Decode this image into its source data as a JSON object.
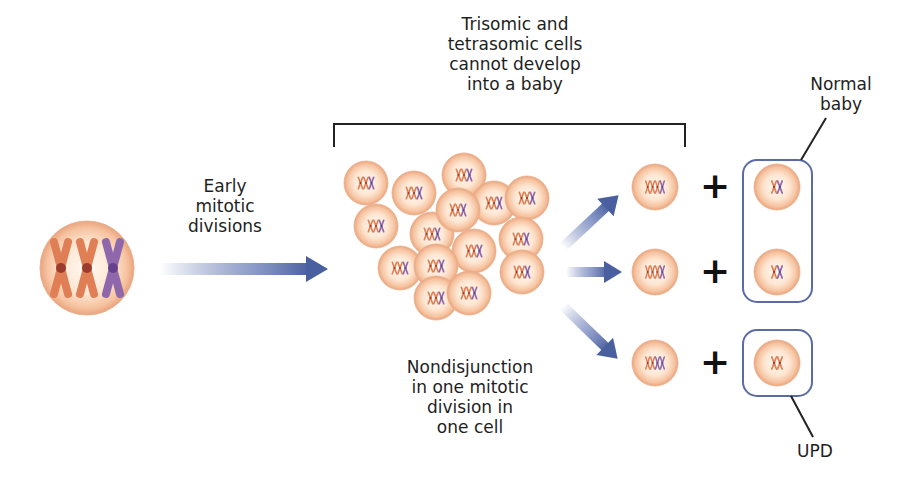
{
  "labels": {
    "early_mitotic": [
      "Early",
      "mitotic",
      "divisions"
    ],
    "trisomic_heading": [
      "Trisomic and",
      "tetrasomic cells",
      "cannot develop",
      "into a baby"
    ],
    "nondisjunction": [
      "Nondisjunction",
      "in one mitotic",
      "division in",
      "one cell"
    ],
    "normal_baby": [
      "Normal",
      "baby"
    ],
    "upd": "UPD"
  },
  "colors": {
    "cell_fill": "#fbe3cf",
    "cell_edge": "#e8a57f",
    "chromosome_orange": "#e07f55",
    "chromosome_purple": "#8e68aa",
    "centromere_orange": "#9b3b2e",
    "centromere_purple": "#65408c",
    "arrow_blue": "#4a5fa0",
    "box_blue": "#5a6ba6",
    "line_black": "#222222"
  },
  "founder_cell": {
    "cx": 87,
    "cy": 268,
    "r": 47,
    "chromosomes": [
      "orange",
      "orange",
      "purple"
    ]
  },
  "cluster_cells": [
    {
      "cx": 366,
      "cy": 183
    },
    {
      "cx": 414,
      "cy": 193
    },
    {
      "cx": 464,
      "cy": 175
    },
    {
      "cx": 494,
      "cy": 203
    },
    {
      "cx": 527,
      "cy": 198
    },
    {
      "cx": 376,
      "cy": 226
    },
    {
      "cx": 432,
      "cy": 234
    },
    {
      "cx": 521,
      "cy": 239
    },
    {
      "cx": 458,
      "cy": 210
    },
    {
      "cx": 400,
      "cy": 268
    },
    {
      "cx": 474,
      "cy": 251
    },
    {
      "cx": 522,
      "cy": 272
    },
    {
      "cx": 436,
      "cy": 266
    },
    {
      "cx": 436,
      "cy": 298
    },
    {
      "cx": 469,
      "cy": 293
    }
  ],
  "outcomes": [
    {
      "tetrasomic": [
        "orange",
        "orange",
        "orange",
        "purple"
      ],
      "daughter": [
        "orange",
        "purple"
      ],
      "cy": 187
    },
    {
      "tetrasomic": [
        "orange",
        "orange",
        "orange",
        "purple"
      ],
      "daughter": [
        "orange",
        "purple"
      ],
      "cy": 272
    },
    {
      "tetrasomic": [
        "orange",
        "orange",
        "purple",
        "purple"
      ],
      "daughter": [
        "orange",
        "orange"
      ],
      "cy": 363
    }
  ],
  "plus_sign": "+"
}
